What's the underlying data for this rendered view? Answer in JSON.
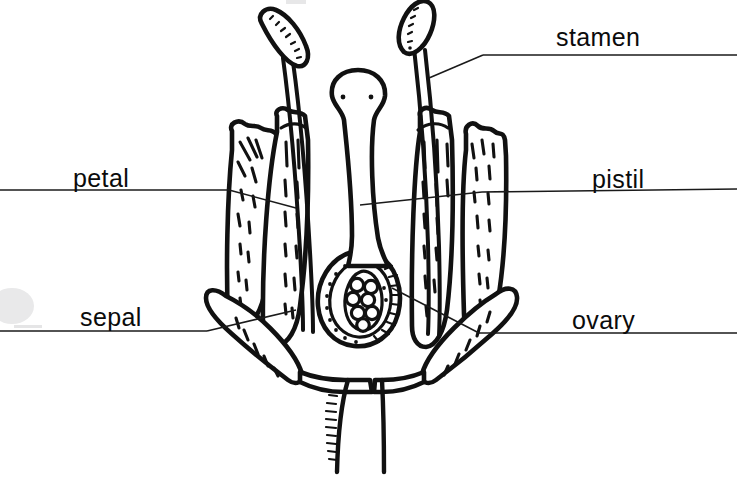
{
  "diagram": {
    "background_color": "#ffffff",
    "ink_color": "#111111",
    "labels": [
      {
        "key": "stamen",
        "text": "stamen",
        "position": "top-right",
        "text_x": 556,
        "text_y": 46,
        "rule_y": 55,
        "rule_x_start": 483,
        "rule_x_end": 737,
        "leader": "M 483 55 L 429 78"
      },
      {
        "key": "petal",
        "text": "petal",
        "position": "middle-left",
        "text_x": 73,
        "text_y": 187,
        "rule_y": 190,
        "rule_x_start": 0,
        "rule_x_end": 229,
        "leader": "M 229 190 L 292 207"
      },
      {
        "key": "pistil",
        "text": "pistil",
        "position": "middle-right",
        "text_x": 592,
        "text_y": 188,
        "rule_y": 192,
        "rule_x_start": 482,
        "rule_x_end": 737,
        "leader": "M 482 192 L 362 204"
      },
      {
        "key": "sepal",
        "text": "sepal",
        "position": "bottom-left",
        "text_x": 80,
        "text_y": 326,
        "rule_y": 330,
        "rule_x_start": 0,
        "rule_x_end": 207,
        "leader": "M 207 330 L 292 311"
      },
      {
        "key": "ovary",
        "text": "ovary",
        "position": "bottom-right",
        "text_x": 572,
        "text_y": 329,
        "rule_y": 333,
        "rule_x_start": 479,
        "rule_x_end": 737,
        "leader": "M 479 333 L 392 288"
      }
    ],
    "parts": [
      {
        "name": "anther-left",
        "description": "stippled elongated anther, left stamen"
      },
      {
        "name": "anther-right",
        "description": "stippled elongated anther, right stamen"
      },
      {
        "name": "filament-left",
        "description": "curved stalk of left stamen"
      },
      {
        "name": "filament-right",
        "description": "curved stalk of right stamen"
      },
      {
        "name": "stigma",
        "description": "bulbous cap at top of pistil"
      },
      {
        "name": "style",
        "description": "narrow column below stigma"
      },
      {
        "name": "ovary",
        "description": "swollen base of pistil with ovules"
      },
      {
        "name": "ovules",
        "description": "cluster of round ovules inside ovary"
      },
      {
        "name": "petal-left-outer",
        "description": "outer left petal with dashed veins"
      },
      {
        "name": "petal-left-inner",
        "description": "inner left petal"
      },
      {
        "name": "petal-right-inner",
        "description": "inner right petal"
      },
      {
        "name": "petal-right-outer",
        "description": "outer right petal with dashed veins"
      },
      {
        "name": "sepal-left",
        "description": "recurved left sepal"
      },
      {
        "name": "sepal-right",
        "description": "recurved right sepal"
      },
      {
        "name": "receptacle",
        "description": "base where sepals join"
      },
      {
        "name": "pedicel",
        "description": "stem below the flower, hatched left edge"
      }
    ],
    "artifacts": [
      {
        "name": "scan-smudge-left",
        "x": 0,
        "y": 288,
        "width": 34,
        "height": 34
      },
      {
        "name": "scan-bar-left",
        "x": 14,
        "y": 325,
        "width": 28,
        "height": 4
      },
      {
        "name": "scan-bar-top",
        "x": 286,
        "y": 0,
        "width": 22,
        "height": 4
      }
    ]
  }
}
